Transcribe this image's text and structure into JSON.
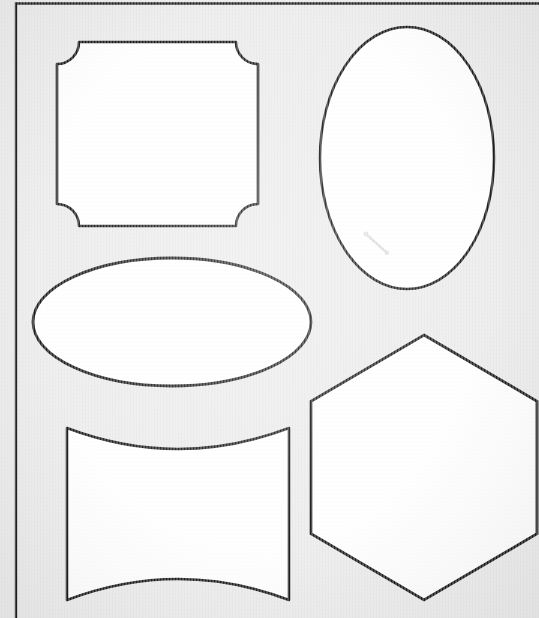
{
  "document": {
    "kind": "scanned-worksheet",
    "title": "Geometric Shape Templates Sheet",
    "background_color": "#eaeaea",
    "ink_color": "#151515",
    "fill_color": "#ffffff",
    "width": 539,
    "height": 618
  },
  "frame": {
    "name": "printed-border-frame",
    "stroke_color": "#1b1b1b",
    "stroke_width": 2,
    "left": 16,
    "top": 3,
    "visible_edges": [
      "top",
      "left"
    ],
    "note": "right and bottom edges are cropped outside the scan"
  },
  "shapes": [
    {
      "id": "concave-corner-square",
      "label": "Square with concave corners",
      "position": "top-left",
      "fill": "#ffffff",
      "stroke": "#151515",
      "bounds": {
        "x": 57,
        "y": 42,
        "width": 201,
        "height": 184
      },
      "corner_radius": 22
    },
    {
      "id": "vertical-ellipse",
      "label": "Vertical ellipse",
      "position": "top-right",
      "fill": "#ffffff",
      "stroke": "#151515",
      "bounds": {
        "x": 320,
        "y": 27,
        "width": 174,
        "height": 262
      },
      "center": {
        "cx": 407,
        "cy": 158
      },
      "radii": {
        "rx": 87,
        "ry": 131
      }
    },
    {
      "id": "horizontal-ellipse",
      "label": "Horizontal ellipse",
      "position": "middle-left",
      "fill": "#ffffff",
      "stroke": "#151515",
      "bounds": {
        "x": 33,
        "y": 258,
        "width": 278,
        "height": 128
      },
      "center": {
        "cx": 172,
        "cy": 322
      },
      "radii": {
        "rx": 139,
        "ry": 64
      }
    },
    {
      "id": "concave-barrel-square",
      "label": "Square with concave top and bottom edges",
      "position": "bottom-left",
      "fill": "#ffffff",
      "stroke": "#151515",
      "bounds": {
        "x": 67,
        "y": 428,
        "width": 222,
        "height": 172
      },
      "curve_depth": 24
    },
    {
      "id": "hexagon",
      "label": "Regular hexagon",
      "position": "bottom-right",
      "fill": "#ffffff",
      "stroke": "#151515",
      "bounds": {
        "x": 311,
        "y": 335,
        "width": 226,
        "height": 265
      },
      "orientation": "pointy-top"
    }
  ],
  "artifacts": [
    {
      "id": "pencil-smudge",
      "label": "Faint pencil mark inside vertical ellipse",
      "color": "#c9c9c9",
      "x": 366,
      "y": 234,
      "length": 28,
      "angle_deg": 42
    }
  ]
}
